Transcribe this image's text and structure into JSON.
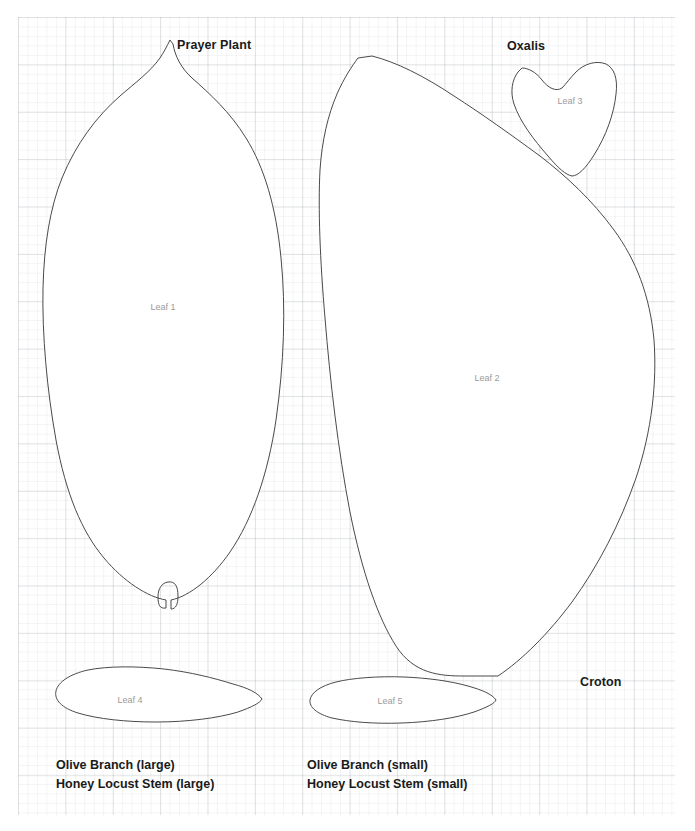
{
  "page": {
    "width": 695,
    "height": 831,
    "background_color": "#ffffff",
    "grid_color": "#cfd6dc",
    "outline_color": "#4a4a4a",
    "label_color": "#1a1a1a",
    "leaf_label_color": "#9b9b9b"
  },
  "plant_labels": [
    {
      "text": "Prayer Plant",
      "x": 177,
      "y": 38
    },
    {
      "text": "Oxalis",
      "x": 507,
      "y": 39
    },
    {
      "text": "Croton",
      "x": 580,
      "y": 675
    }
  ],
  "leaves": [
    {
      "name": "Leaf 1",
      "label": "Leaf 1",
      "cx": 163,
      "cy": 302
    },
    {
      "name": "Leaf 2",
      "label": "Leaf 2",
      "cx": 487,
      "cy": 373
    },
    {
      "name": "Leaf 3",
      "label": "Leaf 3",
      "cx": 570,
      "cy": 96
    },
    {
      "name": "Leaf 4",
      "label": "Leaf 4",
      "cx": 130,
      "cy": 695
    },
    {
      "name": "Leaf 5",
      "label": "Leaf 5",
      "cx": 390,
      "cy": 696
    }
  ],
  "captions": [
    {
      "x": 56,
      "y": 756,
      "line1": "Olive Branch (large)",
      "line2": "Honey Locust Stem (large)"
    },
    {
      "x": 307,
      "y": 756,
      "line1": "Olive Branch (small)",
      "line2": "Honey Locust Stem (small)"
    }
  ],
  "shape_paths": {
    "leaf1": "M170,40 C167,46 164,52 160,58 C150,72 136,82 120,96 C96,117 76,144 62,178 C50,208 44,245 43,288 C42,335 47,390 56,440 C66,494 82,532 104,558 C124,582 148,597 166,600 L166,608 C160,609 158,605 158,597 C158,588 162,583 168,582 C175,581 178,586 178,596 C178,604 176,609 171,609 L171,600 C190,596 212,578 230,552 C252,520 268,474 276,420 C284,364 286,308 281,258 C276,206 264,167 246,138 C230,112 210,94 192,78 C181,68 175,56 173,44 Z",
    "leaf2": "M358,58 C352,66 344,78 337,94 C328,115 322,140 320,170 C318,208 320,260 325,318 C330,380 338,450 350,512 C362,572 378,618 396,646 C414,674 440,676 464,676 L498,676 C522,660 548,634 572,602 C598,566 620,524 636,478 C652,430 657,382 654,340 C650,296 636,260 614,230 C592,200 566,176 540,156 C510,134 482,114 454,96 C424,76 396,62 372,56 Z",
    "leaf3": "M518,72 C512,80 510,92 514,104 C520,122 534,140 548,156 C558,168 566,175 572,176 C578,176 586,168 594,155 C606,136 614,114 616,94 C618,78 614,68 606,64 C596,60 584,64 576,72 C570,78 566,84 562,88 C556,92 548,88 542,80 C536,72 528,68 522,68 Z",
    "leaf4": "M262,699 C258,693 248,688 233,684 C214,678 190,672 164,669 C136,666 108,666 88,670 C70,674 58,682 56,691 C54,700 62,708 78,713 C98,719 126,722 156,722 C188,722 218,718 238,712 C252,707 260,703 262,699 Z",
    "leaf5": "M496,700 C492,694 482,690 468,686 C450,681 428,678 404,677 C378,676 352,678 336,682 C320,686 311,693 310,700 C309,707 317,714 332,718 C350,722 374,724 402,723 C430,722 456,718 474,712 C488,707 495,703 496,700 Z"
  }
}
